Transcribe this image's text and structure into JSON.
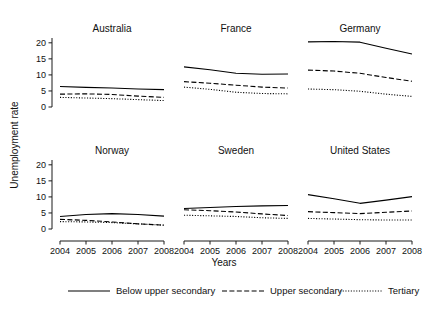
{
  "chart_data": {
    "type": "line",
    "title": "",
    "xlabel": "Years",
    "ylabel": "Unemployment rate",
    "x": [
      2004,
      2005,
      2006,
      2007,
      2008
    ],
    "xtick_labels": [
      "2004",
      "2005",
      "2006",
      "2007",
      "2008"
    ],
    "ytick_labels": [
      "0",
      "5",
      "10",
      "15",
      "20"
    ],
    "yticks": [
      0,
      5,
      10,
      15,
      20
    ],
    "ylim": [
      0,
      21.5
    ],
    "xlim": [
      2004,
      2008
    ],
    "grid": false,
    "legend_position": "bottom",
    "layout": "small-multiples 2 rows x 3 columns",
    "series_styles": [
      "solid",
      "dashed",
      "dotted"
    ],
    "legend": [
      {
        "label": "Below upper secondary",
        "style": "solid"
      },
      {
        "label": "Upper secondary",
        "style": "dashed"
      },
      {
        "label": "Tertiary",
        "style": "dotted"
      }
    ],
    "panels": [
      {
        "title": "Australia",
        "series": [
          {
            "name": "Below upper secondary",
            "style": "solid",
            "values": [
              6.4,
              6.1,
              5.9,
              5.6,
              5.4
            ]
          },
          {
            "name": "Upper secondary",
            "style": "dashed",
            "values": [
              4.0,
              4.1,
              3.9,
              3.4,
              3.0
            ]
          },
          {
            "name": "Tertiary",
            "style": "dotted",
            "values": [
              3.0,
              2.8,
              2.6,
              2.3,
              2.0
            ]
          }
        ]
      },
      {
        "title": "France",
        "series": [
          {
            "name": "Below upper secondary",
            "style": "solid",
            "values": [
              12.5,
              11.6,
              10.5,
              10.2,
              10.3
            ]
          },
          {
            "name": "Upper secondary",
            "style": "dashed",
            "values": [
              7.9,
              7.4,
              6.8,
              6.2,
              5.9
            ]
          },
          {
            "name": "Tertiary",
            "style": "dotted",
            "values": [
              6.2,
              5.5,
              4.6,
              4.2,
              4.1
            ]
          }
        ]
      },
      {
        "title": "Germany",
        "series": [
          {
            "name": "Below upper secondary",
            "style": "solid",
            "values": [
              20.3,
              20.4,
              20.2,
              18.3,
              16.5
            ]
          },
          {
            "name": "Upper secondary",
            "style": "dashed",
            "values": [
              11.5,
              11.2,
              10.5,
              9.2,
              8.0
            ]
          },
          {
            "name": "Tertiary",
            "style": "dotted",
            "values": [
              5.6,
              5.4,
              4.9,
              4.0,
              3.3
            ]
          }
        ]
      },
      {
        "title": "Norway",
        "series": [
          {
            "name": "Below upper secondary",
            "style": "solid",
            "values": [
              3.9,
              4.5,
              4.8,
              4.5,
              4.0
            ]
          },
          {
            "name": "Upper secondary",
            "style": "dashed",
            "values": [
              3.0,
              2.7,
              2.2,
              1.6,
              1.2
            ]
          },
          {
            "name": "Tertiary",
            "style": "dotted",
            "values": [
              2.3,
              2.2,
              2.0,
              1.6,
              1.2
            ]
          }
        ]
      },
      {
        "title": "Sweden",
        "series": [
          {
            "name": "Below upper secondary",
            "style": "solid",
            "values": [
              6.4,
              6.7,
              7.0,
              7.2,
              7.3
            ]
          },
          {
            "name": "Upper secondary",
            "style": "dashed",
            "values": [
              6.0,
              5.7,
              5.3,
              4.7,
              4.2
            ]
          },
          {
            "name": "Tertiary",
            "style": "dotted",
            "values": [
              4.3,
              4.1,
              3.9,
              3.5,
              3.3
            ]
          }
        ]
      },
      {
        "title": "United States",
        "series": [
          {
            "name": "Below upper secondary",
            "style": "solid",
            "values": [
              10.7,
              9.4,
              8.0,
              9.0,
              10.1
            ]
          },
          {
            "name": "Upper secondary",
            "style": "dashed",
            "values": [
              5.4,
              5.1,
              4.8,
              5.2,
              5.6
            ]
          },
          {
            "name": "Tertiary",
            "style": "dotted",
            "values": [
              3.3,
              3.1,
              2.9,
              2.8,
              2.8
            ]
          }
        ]
      }
    ]
  }
}
